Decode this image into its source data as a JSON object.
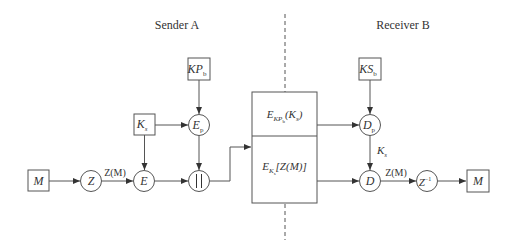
{
  "diagram": {
    "sections": {
      "sender": "Sender A",
      "receiver": "Receiver B"
    },
    "sender_nodes": {
      "message": {
        "main": "M",
        "sub": ""
      },
      "compress": {
        "main": "Z",
        "sub": ""
      },
      "session_key": {
        "main": "K",
        "sub": "s"
      },
      "public_key": {
        "main": "KP",
        "sub": "b"
      },
      "encrypt_public": {
        "main": "E",
        "sub": "p"
      },
      "encrypt": {
        "main": "E",
        "sub": ""
      },
      "concat": {
        "main": "||",
        "sub": ""
      }
    },
    "sender_edges": {
      "compressed_label": "Z(M)"
    },
    "channel": {
      "top": {
        "main": "E",
        "sub": "KP",
        "subsub": "b",
        "arg": "(K",
        "argsub": "s",
        "argend": ")"
      },
      "bottom": {
        "main": "E",
        "sub": "K",
        "subsub": "s",
        "arg": "[Z(M)]"
      }
    },
    "receiver_nodes": {
      "secret_key": {
        "main": "KS",
        "sub": "b"
      },
      "decrypt_private": {
        "main": "D",
        "sub": "p"
      },
      "decrypt": {
        "main": "D",
        "sub": ""
      },
      "decompress": {
        "main": "Z",
        "sup": "−1"
      },
      "message": {
        "main": "M",
        "sub": ""
      }
    },
    "receiver_edges": {
      "session_key_label": {
        "main": "K",
        "sub": "s"
      },
      "compressed_label": "Z(M)"
    },
    "colors": {
      "stroke": "#555555",
      "text": "#333333",
      "background": "#ffffff"
    }
  }
}
